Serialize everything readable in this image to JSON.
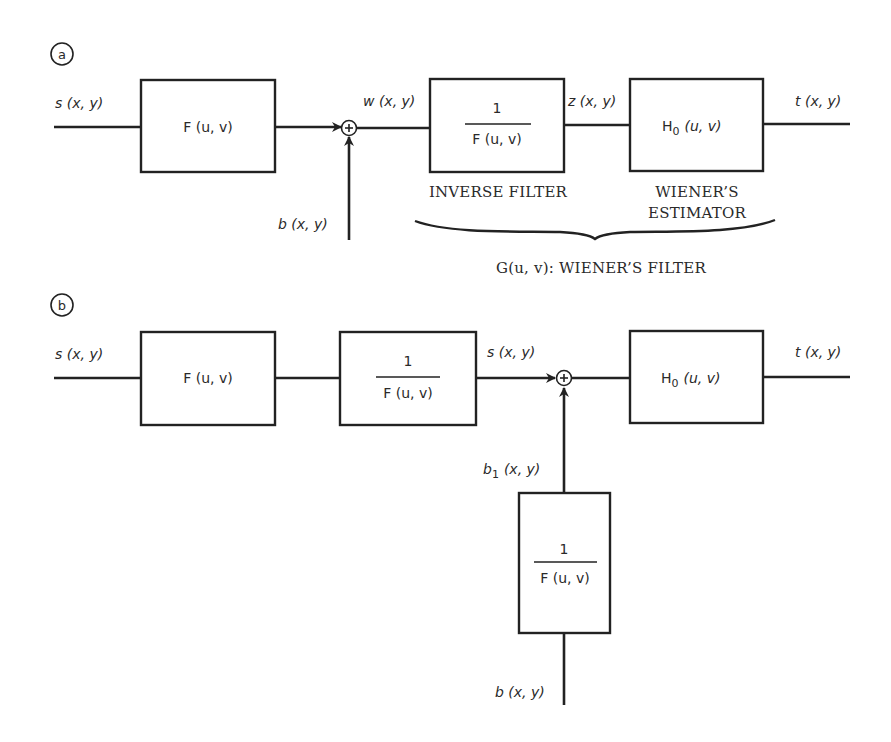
{
  "figure": {
    "panel_a": {
      "tag": "a",
      "input_label": "s (x, y)",
      "block1": "F (u, v)",
      "sum_symbol": "+",
      "noise_label": "b (x, y)",
      "w_label": "w (x, y)",
      "inverse_num": "1",
      "inverse_den": "F (u, v)",
      "z_label": "z (x, y)",
      "estimator_block": "H0 (u, v)",
      "estimator_main": "H",
      "estimator_sub": "0",
      "estimator_args": "(u, v)",
      "output_label": "t (x, y)",
      "inverse_caption": "INVERSE FILTER",
      "estimator_caption_1": "WIENER’S",
      "estimator_caption_2": "ESTIMATOR",
      "brace_caption": "G(u, v): WIENER’S FILTER"
    },
    "panel_b": {
      "tag": "b",
      "input_label": "s (x, y)",
      "block1": "F (u, v)",
      "inverse_num": "1",
      "inverse_den": "F (u, v)",
      "s_label": "s (x, y)",
      "sum_symbol": "+",
      "estimator_main": "H",
      "estimator_sub": "0",
      "estimator_args": "(u, v)",
      "output_label": "t (x, y)",
      "b1_main": "b",
      "b1_sub": "1",
      "b1_args": "(x, y)",
      "noise_inverse_num": "1",
      "noise_inverse_den": "F (u, v)",
      "noise_label": "b (x, y)"
    }
  }
}
